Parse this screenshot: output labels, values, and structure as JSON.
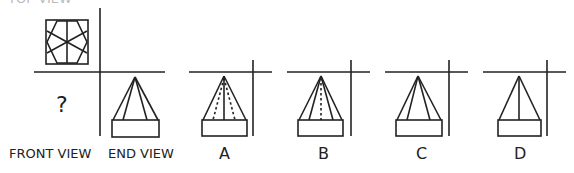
{
  "question": {
    "top_label_partial": "TOP VIEW",
    "unknown_mark": "?",
    "labels": {
      "front_view": "FRONT VIEW",
      "end_view": "END VIEW"
    },
    "options": [
      {
        "label": "A",
        "lines": [
          "dotted-left",
          "solid-center",
          "dotted-right"
        ]
      },
      {
        "label": "B",
        "lines": [
          "solid-left",
          "dotted-center",
          "solid-right"
        ]
      },
      {
        "label": "C",
        "lines": [
          "solid-left",
          "solid-right"
        ]
      },
      {
        "label": "D",
        "lines": [
          "solid-center"
        ]
      }
    ]
  }
}
